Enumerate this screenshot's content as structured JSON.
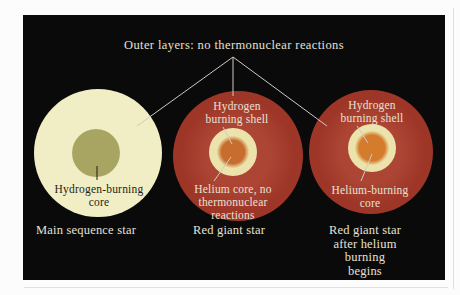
{
  "figure": {
    "outer_label": "Outer layers: no thermonuclear reactions",
    "stars": [
      {
        "caption": "Main sequence star",
        "core_label": "Hydrogen-burning\ncore"
      },
      {
        "caption": "Red giant star",
        "shell_label": "Hydrogen\nburning shell",
        "core_label": "Helium core, no\nthermonuclear\nreactions"
      },
      {
        "caption": "Red giant star\nafter helium burning\nbegins",
        "shell_label": "Hydrogen\nburning shell",
        "core_label": "Helium-burning\ncore"
      }
    ]
  },
  "colors": {
    "panel_bg": "#0a0a0a",
    "text_light": "#e7e1d4",
    "text_dark": "#1f1f14",
    "line": "#cfcbc2",
    "ms_body": "#f1eec6",
    "ms_core": "#a8a562",
    "rg_body": "#9e3628",
    "rg_body_light": "#ad4534",
    "ring": "#ece3ac",
    "rg_core": "#c76d2d",
    "rg_core_bright": "#d47c2c"
  }
}
